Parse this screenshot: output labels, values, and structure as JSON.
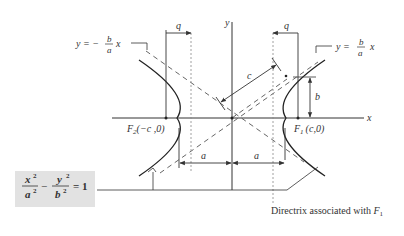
{
  "diagram": {
    "axes": {
      "x_label": "x",
      "y_label": "y"
    },
    "asymptotes": {
      "left": {
        "lhs": "y = −",
        "num": "b",
        "den": "a",
        "var": "x"
      },
      "right": {
        "lhs": "y =",
        "num": "b",
        "den": "a",
        "var": "x"
      }
    },
    "foci": {
      "left": {
        "name": "F",
        "sub": "2",
        "coords": "(−c ,0)"
      },
      "right": {
        "name": "F",
        "sub": "1",
        "coords": "(c,0)"
      }
    },
    "dimensions": {
      "q_left": "q",
      "q_right": "q",
      "c": "c",
      "b": "b",
      "a_left": "a",
      "a_right": "a"
    },
    "equation": {
      "x_term": "x",
      "x_den": "a",
      "y_term": "y",
      "y_den": "b",
      "exp": "2",
      "minus": "−",
      "equals": "= 1"
    },
    "directrix_caption": {
      "text": "Directrix associated with ",
      "focus": "F",
      "sub": "1"
    },
    "colors": {
      "line": "#333333",
      "dashed": "#555555",
      "dotted": "#888888",
      "box": "#e2e2e2"
    }
  }
}
